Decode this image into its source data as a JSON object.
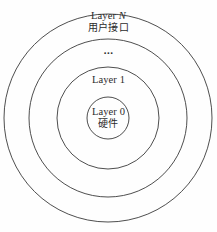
{
  "diagram": {
    "type": "concentric-layer-model",
    "background_color": "#fefefe",
    "stroke_color": "#3a3a3a",
    "center": {
      "x": 108,
      "y": 118
    },
    "rings": [
      {
        "name": "layer-n-ring",
        "radius": 104,
        "label_key": "layer_n"
      },
      {
        "name": "layer-intermediate-ring",
        "radius": 79,
        "label_key": "ellipsis"
      },
      {
        "name": "layer-1-ring",
        "radius": 51,
        "label_key": "layer_1"
      },
      {
        "name": "layer-0-ring",
        "radius": 21,
        "label_key": "layer_0"
      }
    ],
    "labels": {
      "layer_n": {
        "en_prefix": "Layer ",
        "en_variable": "N",
        "cn": "用户接口"
      },
      "ellipsis": {
        "text": "..."
      },
      "layer_1": {
        "en": "Layer 1"
      },
      "layer_0": {
        "en": "Layer 0",
        "cn": "硬件"
      }
    }
  }
}
